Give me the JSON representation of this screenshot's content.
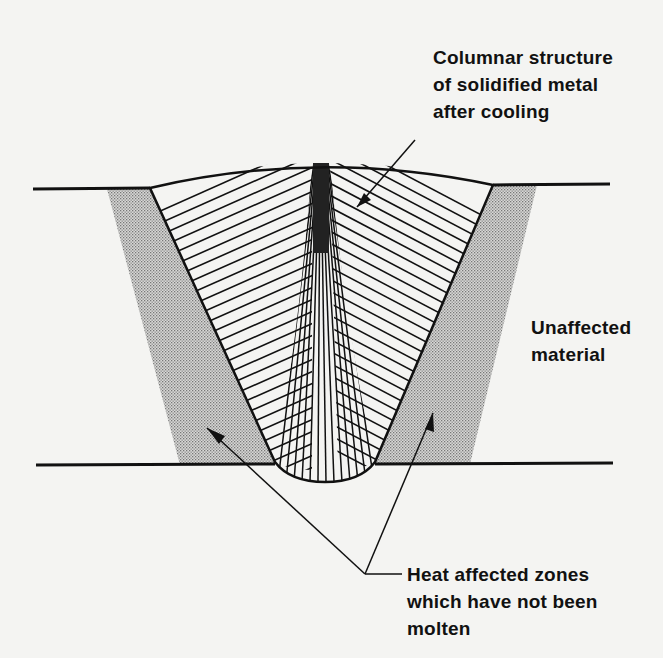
{
  "diagram": {
    "type": "weld cross-section",
    "labels": {
      "columnar": {
        "lines": [
          "Columnar structure",
          "of solidified metal",
          "after cooling"
        ]
      },
      "unaffected": {
        "lines": [
          "Unaffected",
          "material"
        ]
      },
      "haz": {
        "lines": [
          "Heat affected zones",
          "which have not been",
          "molten"
        ]
      }
    },
    "regions": [
      {
        "name": "weld-metal",
        "description": "Columnar structure of solidified metal"
      },
      {
        "name": "heat-affected-zone-left",
        "description": "Heat affected zone (stippled)"
      },
      {
        "name": "heat-affected-zone-right",
        "description": "Heat affected zone (stippled)"
      },
      {
        "name": "base-plate",
        "description": "Unaffected material"
      }
    ],
    "colors": {
      "ink": "#111111",
      "paper": "#f4f4f2",
      "stipple": "#9a9a9a"
    }
  }
}
